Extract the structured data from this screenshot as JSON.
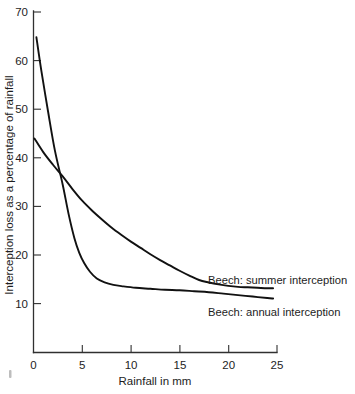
{
  "chart_data": {
    "type": "line",
    "title": "",
    "xlabel": "Rainfall in mm",
    "ylabel": "Interception loss as a percentage of rainfall",
    "xlim": [
      0,
      25
    ],
    "ylim": [
      0,
      70
    ],
    "xticks": [
      0,
      5,
      10,
      15,
      20,
      25
    ],
    "yticks": [
      10,
      20,
      30,
      40,
      50,
      60,
      70
    ],
    "xtick_labels": [
      "0",
      "5",
      "10",
      "15",
      "20",
      "25"
    ],
    "ytick_labels": [
      "10",
      "20",
      "30",
      "40",
      "50",
      "60",
      "70"
    ],
    "grid": false,
    "legend_position": "inline-right",
    "line_color": "#111111",
    "axis_color": "#303030",
    "background": "#ffffff",
    "series": [
      {
        "name": "Beech: summer interception",
        "label_x": 25.0,
        "label_y": 15.5,
        "x": [
          0.1,
          1.0,
          2.0,
          3.0,
          4.0,
          5.0,
          6.0,
          7.0,
          8.0,
          9.0,
          10.0,
          11.0,
          12.0,
          13.0,
          14.0,
          15.0,
          16.0,
          17.0,
          18.0,
          19.0,
          20.0,
          21.0,
          22.0,
          23.0,
          24.0,
          24.6
        ],
        "y": [
          44.0,
          41.2,
          38.6,
          36.2,
          33.6,
          31.2,
          29.2,
          27.4,
          25.7,
          24.2,
          22.8,
          21.5,
          20.2,
          19.0,
          17.9,
          16.8,
          15.8,
          14.9,
          14.4,
          14.0,
          13.7,
          13.5,
          13.4,
          13.3,
          13.2,
          13.2
        ]
      },
      {
        "name": "Beech: annual interception",
        "label_x": 25.0,
        "label_y": 10.0,
        "x": [
          0.3,
          0.8,
          1.5,
          2.2,
          3.0,
          3.6,
          4.2,
          4.7,
          5.2,
          5.8,
          6.5,
          7.3,
          8.2,
          9.2,
          10.5,
          12.0,
          13.5,
          15.0,
          16.5,
          18.0,
          19.5,
          21.0,
          22.5,
          24.0,
          24.6
        ],
        "y": [
          64.8,
          58.0,
          49.5,
          41.5,
          34.5,
          28.5,
          23.5,
          20.5,
          18.4,
          16.6,
          15.2,
          14.4,
          13.9,
          13.6,
          13.3,
          13.1,
          12.9,
          12.8,
          12.6,
          12.4,
          12.1,
          11.8,
          11.5,
          11.2,
          11.1
        ]
      }
    ]
  },
  "labels": {
    "summer": "Beech: summer interception",
    "annual": "Beech: annual interception",
    "xaxis": "Rainfall in mm",
    "yaxis": "Interception loss as a percentage of rainfall"
  }
}
